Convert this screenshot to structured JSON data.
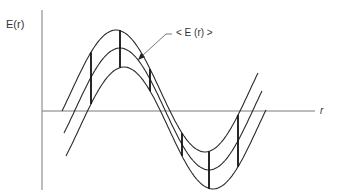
{
  "diagram": {
    "y_axis_label": "E(r)",
    "x_axis_label": "r",
    "annotation": "< E (r) >",
    "curves": [
      {
        "name": "upper-bound",
        "role": "upper envelope"
      },
      {
        "name": "mean",
        "role": "average E(r)"
      },
      {
        "name": "lower-bound",
        "role": "lower envelope"
      }
    ],
    "error_bar_count": 6,
    "colors": {
      "curve": "#2a2a2a",
      "axis": "#7a7a7a",
      "text": "#333333"
    }
  }
}
